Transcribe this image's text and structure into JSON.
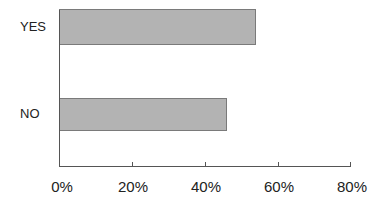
{
  "chart_data": {
    "type": "bar",
    "orientation": "horizontal",
    "title": "",
    "xlabel": "",
    "ylabel": "",
    "categories": [
      "YES",
      "NO"
    ],
    "values": [
      54,
      46
    ],
    "value_unit": "%",
    "xlim": [
      0,
      80
    ],
    "xticks": [
      "0%",
      "20%",
      "40%",
      "60%",
      "80%"
    ],
    "grid": false,
    "legend": null,
    "bar_color": "#b3b3b3"
  },
  "labels": {
    "yes": "YES",
    "no": "NO",
    "ticks": [
      "0%",
      "20%",
      "40%",
      "60%",
      "80%"
    ]
  }
}
